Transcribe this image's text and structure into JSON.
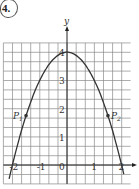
{
  "problem": {
    "number": "4."
  },
  "chart_data": {
    "type": "line",
    "title": "",
    "function": "y = 4 - x^2",
    "xlabel": "",
    "ylabel": "y",
    "xlim": [
      -2.33,
      2.33
    ],
    "ylim": [
      -0.67,
      4.33
    ],
    "grid": true,
    "grid_step": 0.3333,
    "x_ticks": [
      -2,
      -1,
      0,
      1,
      2
    ],
    "x_tick_labels": [
      "-2",
      "-1",
      "0",
      "1",
      "2"
    ],
    "y_ticks": [
      1,
      2,
      3,
      4
    ],
    "y_tick_labels": [
      "1",
      "2",
      "3",
      "4"
    ],
    "series": [
      {
        "name": "parabola",
        "x": [
          -2,
          -1.5,
          -1,
          -0.5,
          0,
          0.5,
          1,
          1.5,
          2
        ],
        "y": [
          0,
          1.75,
          3,
          3.75,
          4,
          3.75,
          3,
          1.75,
          0
        ]
      }
    ],
    "points": [
      {
        "label": "P1",
        "display": "P",
        "sub": "1",
        "x": -1.5,
        "y": 1.75
      },
      {
        "label": "P2",
        "display": "P",
        "sub": "2",
        "x": 1.5,
        "y": 1.75
      }
    ],
    "colors": {
      "grid": "#8a8a8a",
      "curve": "#333333",
      "axis": "#222222"
    }
  }
}
